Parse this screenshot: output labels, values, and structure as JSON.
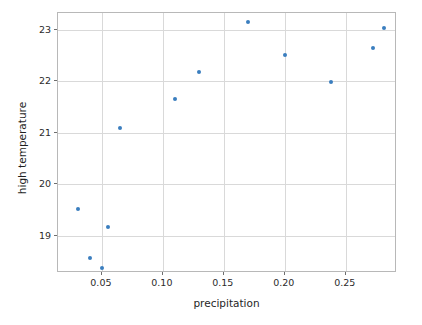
{
  "chart_data": {
    "type": "scatter",
    "title": "",
    "xlabel": "precipitation",
    "ylabel": "high temperature",
    "xlim": [
      0.014,
      0.292
    ],
    "ylim": [
      18.28,
      23.32
    ],
    "xticks": [
      0.05,
      0.1,
      0.15,
      0.2,
      0.25
    ],
    "xtick_labels": [
      "0.05",
      "0.10",
      "0.15",
      "0.20",
      "0.25"
    ],
    "yticks": [
      19,
      20,
      21,
      22,
      23
    ],
    "ytick_labels": [
      "19",
      "20",
      "21",
      "22",
      "23"
    ],
    "grid": true,
    "legend": false,
    "marker_color": "#3a7ebf",
    "points": [
      {
        "x": 0.03,
        "y": 19.52
      },
      {
        "x": 0.04,
        "y": 18.57
      },
      {
        "x": 0.05,
        "y": 18.37
      },
      {
        "x": 0.055,
        "y": 19.17
      },
      {
        "x": 0.065,
        "y": 21.1
      },
      {
        "x": 0.11,
        "y": 21.66
      },
      {
        "x": 0.13,
        "y": 22.18
      },
      {
        "x": 0.17,
        "y": 23.14
      },
      {
        "x": 0.2,
        "y": 22.5
      },
      {
        "x": 0.238,
        "y": 21.98
      },
      {
        "x": 0.272,
        "y": 22.65
      },
      {
        "x": 0.281,
        "y": 23.02
      }
    ]
  }
}
